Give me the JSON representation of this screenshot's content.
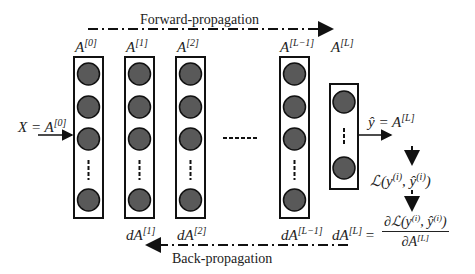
{
  "diagram": {
    "title_forward": "Forward-propagation",
    "title_backward": "Back-propagation",
    "input_label": "X = A",
    "input_sup": "[0]",
    "layers": [
      {
        "name": "A",
        "sup": "[0]",
        "grad": "",
        "grad_sup": ""
      },
      {
        "name": "A",
        "sup": "[1]",
        "grad": "dA",
        "grad_sup": "[1]"
      },
      {
        "name": "A",
        "sup": "[2]",
        "grad": "dA",
        "grad_sup": "[2]"
      },
      {
        "name": "A",
        "sup": "[L−1]",
        "grad": "dA",
        "grad_sup": "[L−1]"
      },
      {
        "name": "A",
        "sup": "[L]",
        "grad": "dA",
        "grad_sup": "[L]"
      }
    ],
    "output_label": "ŷ = A",
    "output_sup": "[L]",
    "loss_label": "ℒ(y",
    "loss_sup1": "(i)",
    "loss_mid": ", ŷ",
    "loss_sup2": "(i)",
    "loss_end": ")",
    "grad_eq": "=",
    "grad_num": "∂ℒ(y",
    "grad_num_sup1": "(i)",
    "grad_num_mid": ", ŷ",
    "grad_num_sup2": "(i)",
    "grad_num_end": ")",
    "grad_den": "∂A",
    "grad_den_sup": "[L]",
    "colors": {
      "node_fill": "#595959",
      "stroke": "#111111",
      "text": "#222222"
    }
  }
}
